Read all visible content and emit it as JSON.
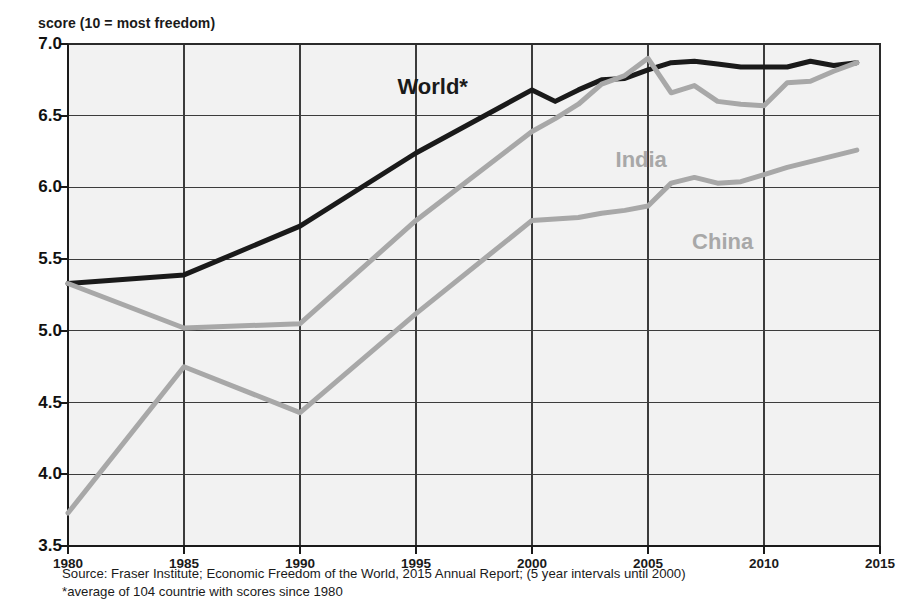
{
  "chart_data": {
    "type": "line",
    "title": "",
    "ylabel": "score (10 = most freedom)",
    "xlabel": "",
    "ylim": [
      3.5,
      7.0
    ],
    "xlim": [
      1980,
      2015
    ],
    "grid": true,
    "legend_position": "inline-annotations",
    "ytick_labels": [
      "7.0",
      "6.5",
      "6.0",
      "5.5",
      "5.0",
      "4.5",
      "4.0",
      "3.5"
    ],
    "ytick_values": [
      7.0,
      6.5,
      6.0,
      5.5,
      5.0,
      4.5,
      4.0,
      3.5
    ],
    "xtick_labels": [
      "1980",
      "1985",
      "1990",
      "1995",
      "2000",
      "2005",
      "2010",
      "2015"
    ],
    "xtick_values": [
      1980,
      1985,
      1990,
      1995,
      2000,
      2005,
      2010,
      2015
    ],
    "series": [
      {
        "name": "World*",
        "color": "#1a1a1a",
        "label_x": 1994.2,
        "label_y": 6.79,
        "x": [
          1980,
          1985,
          1990,
          1995,
          2000,
          2001,
          2002,
          2003,
          2004,
          2005,
          2006,
          2007,
          2008,
          2009,
          2010,
          2011,
          2012,
          2013,
          2014
        ],
        "values": [
          5.33,
          5.39,
          5.73,
          6.24,
          6.68,
          6.6,
          6.68,
          6.75,
          6.76,
          6.82,
          6.87,
          6.88,
          6.86,
          6.84,
          6.84,
          6.84,
          6.88,
          6.85,
          6.87
        ]
      },
      {
        "name": "India",
        "color": "#a8a8a8",
        "label_x": 2003.6,
        "label_y": 6.28,
        "x": [
          1980,
          1985,
          1990,
          1995,
          2000,
          2001,
          2002,
          2003,
          2004,
          2005,
          2006,
          2007,
          2008,
          2009,
          2010,
          2011,
          2012,
          2013,
          2014
        ],
        "values": [
          5.33,
          5.02,
          5.05,
          5.77,
          6.39,
          6.48,
          6.58,
          6.72,
          6.78,
          6.9,
          6.66,
          6.71,
          6.6,
          6.58,
          6.57,
          6.73,
          6.74,
          6.81,
          6.87
        ]
      },
      {
        "name": "China",
        "color": "#a8a8a8",
        "label_x": 2006.9,
        "label_y": 5.71,
        "x": [
          1980,
          1985,
          1990,
          1995,
          2000,
          2001,
          2002,
          2003,
          2004,
          2005,
          2006,
          2007,
          2008,
          2009,
          2010,
          2011,
          2012,
          2013,
          2014
        ],
        "values": [
          3.73,
          4.75,
          4.43,
          5.12,
          5.77,
          5.78,
          5.79,
          5.82,
          5.84,
          5.87,
          6.03,
          6.07,
          6.03,
          6.04,
          6.09,
          6.14,
          6.18,
          6.22,
          6.26
        ]
      }
    ],
    "notes": [
      "Source: Fraser Institute; Economic Freedom of the World, 2015  Annual Report; (5 year intervals until 2000)",
      "*average of 104 countrie with scores  since 1980"
    ]
  }
}
